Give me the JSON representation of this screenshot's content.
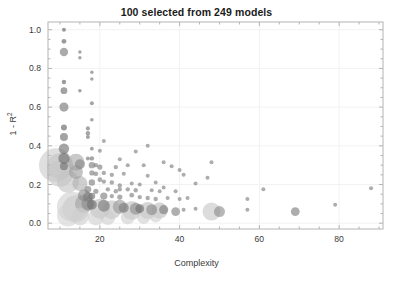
{
  "chart_data": {
    "type": "scatter",
    "title": "100 selected from 249 models",
    "xlabel": "Complexity",
    "ylabel": "1 - R",
    "ylabel_sup": "2",
    "xlim": [
      7,
      91
    ],
    "ylim": [
      -0.03,
      1.04
    ],
    "xticks": [
      20,
      40,
      60,
      80
    ],
    "yticks": [
      "0.0",
      "0.2",
      "0.4",
      "0.6",
      "0.8",
      "1.0"
    ],
    "ytick_values": [
      0.0,
      0.2,
      0.4,
      0.6,
      0.8,
      1.0
    ],
    "grid": true,
    "grid_color": "#f2f2f2",
    "axes_color": "#b4b4b4",
    "marker_dark_color": "#6e6e6e",
    "marker_light_color": "#c8c8c8",
    "marker_opacity": 0.62,
    "background": "#ffffff",
    "legend": "none",
    "points": [
      {
        "x": 11,
        "y": 1.0,
        "s": 2.0,
        "c": "#5e5e5e"
      },
      {
        "x": 11,
        "y": 0.94,
        "s": 2.4,
        "c": "#5e5e5e"
      },
      {
        "x": 11,
        "y": 0.885,
        "s": 4.2,
        "c": "#777777"
      },
      {
        "x": 15,
        "y": 0.885,
        "s": 1.7,
        "c": "#6e6e6e"
      },
      {
        "x": 15,
        "y": 0.855,
        "s": 1.7,
        "c": "#6e6e6e"
      },
      {
        "x": 18,
        "y": 0.78,
        "s": 1.7,
        "c": "#6e6e6e"
      },
      {
        "x": 18,
        "y": 0.745,
        "s": 1.7,
        "c": "#6e6e6e"
      },
      {
        "x": 11,
        "y": 0.73,
        "s": 2.2,
        "c": "#5e5e5e"
      },
      {
        "x": 11,
        "y": 0.685,
        "s": 3.4,
        "c": "#6a6a6a"
      },
      {
        "x": 15,
        "y": 0.685,
        "s": 1.8,
        "c": "#6e6e6e"
      },
      {
        "x": 18,
        "y": 0.62,
        "s": 2.0,
        "c": "#6e6e6e"
      },
      {
        "x": 11,
        "y": 0.6,
        "s": 4.6,
        "c": "#727272"
      },
      {
        "x": 18,
        "y": 0.535,
        "s": 1.8,
        "c": "#6e6e6e"
      },
      {
        "x": 11,
        "y": 0.495,
        "s": 3.0,
        "c": "#5e5e5e"
      },
      {
        "x": 17,
        "y": 0.49,
        "s": 2.1,
        "c": "#6e6e6e"
      },
      {
        "x": 17,
        "y": 0.465,
        "s": 2.2,
        "c": "#6e6e6e"
      },
      {
        "x": 11,
        "y": 0.445,
        "s": 4.0,
        "c": "#6a6a6a"
      },
      {
        "x": 17,
        "y": 0.445,
        "s": 2.0,
        "c": "#6e6e6e"
      },
      {
        "x": 21,
        "y": 0.425,
        "s": 2.0,
        "c": "#7a7a7a"
      },
      {
        "x": 32,
        "y": 0.4,
        "s": 2.0,
        "c": "#7a7a7a"
      },
      {
        "x": 11,
        "y": 0.385,
        "s": 5.2,
        "c": "#6e6e6e"
      },
      {
        "x": 18,
        "y": 0.385,
        "s": 1.9,
        "c": "#6e6e6e"
      },
      {
        "x": 20,
        "y": 0.375,
        "s": 2.0,
        "c": "#7a7a7a"
      },
      {
        "x": 29,
        "y": 0.37,
        "s": 2.0,
        "c": "#7a7a7a"
      },
      {
        "x": 11,
        "y": 0.335,
        "s": 5.6,
        "c": "#6e6e6e"
      },
      {
        "x": 17,
        "y": 0.335,
        "s": 2.0,
        "c": "#6e6e6e"
      },
      {
        "x": 18,
        "y": 0.335,
        "s": 2.2,
        "c": "#6e6e6e"
      },
      {
        "x": 25,
        "y": 0.33,
        "s": 2.0,
        "c": "#7a7a7a"
      },
      {
        "x": 9,
        "y": 0.3,
        "s": 17.0,
        "c": "#cccccc"
      },
      {
        "x": 10,
        "y": 0.295,
        "s": 13.0,
        "c": "#c4c4c4"
      },
      {
        "x": 11,
        "y": 0.295,
        "s": 4.0,
        "c": "#6e6e6e"
      },
      {
        "x": 14,
        "y": 0.315,
        "s": 8.5,
        "c": "#a8a8a8"
      },
      {
        "x": 15,
        "y": 0.305,
        "s": 5.0,
        "c": "#888888"
      },
      {
        "x": 18,
        "y": 0.3,
        "s": 3.2,
        "c": "#7a7a7a"
      },
      {
        "x": 19,
        "y": 0.3,
        "s": 2.2,
        "c": "#7a7a7a"
      },
      {
        "x": 20,
        "y": 0.29,
        "s": 2.6,
        "c": "#7a7a7a"
      },
      {
        "x": 24,
        "y": 0.29,
        "s": 2.2,
        "c": "#7a7a7a"
      },
      {
        "x": 27,
        "y": 0.3,
        "s": 2.0,
        "c": "#7a7a7a"
      },
      {
        "x": 31,
        "y": 0.3,
        "s": 2.0,
        "c": "#7a7a7a"
      },
      {
        "x": 36,
        "y": 0.315,
        "s": 2.0,
        "c": "#7a7a7a"
      },
      {
        "x": 38,
        "y": 0.295,
        "s": 2.0,
        "c": "#7a7a7a"
      },
      {
        "x": 48,
        "y": 0.315,
        "s": 2.0,
        "c": "#7a7a7a"
      },
      {
        "x": 10,
        "y": 0.255,
        "s": 13.0,
        "c": "#c8c8c8"
      },
      {
        "x": 14,
        "y": 0.265,
        "s": 7.0,
        "c": "#9e9e9e"
      },
      {
        "x": 18,
        "y": 0.26,
        "s": 2.6,
        "c": "#7a7a7a"
      },
      {
        "x": 19,
        "y": 0.255,
        "s": 2.4,
        "c": "#7a7a7a"
      },
      {
        "x": 21,
        "y": 0.26,
        "s": 2.2,
        "c": "#7a7a7a"
      },
      {
        "x": 23,
        "y": 0.25,
        "s": 2.2,
        "c": "#7a7a7a"
      },
      {
        "x": 26,
        "y": 0.255,
        "s": 2.0,
        "c": "#7a7a7a"
      },
      {
        "x": 32,
        "y": 0.245,
        "s": 2.0,
        "c": "#7a7a7a"
      },
      {
        "x": 40,
        "y": 0.275,
        "s": 2.0,
        "c": "#7a7a7a"
      },
      {
        "x": 41,
        "y": 0.25,
        "s": 2.0,
        "c": "#7a7a7a"
      },
      {
        "x": 12,
        "y": 0.215,
        "s": 11.0,
        "c": "#c4c4c4"
      },
      {
        "x": 15,
        "y": 0.205,
        "s": 7.5,
        "c": "#b0b0b0"
      },
      {
        "x": 18,
        "y": 0.21,
        "s": 3.2,
        "c": "#7a7a7a"
      },
      {
        "x": 20,
        "y": 0.225,
        "s": 2.4,
        "c": "#7a7a7a"
      },
      {
        "x": 21,
        "y": 0.215,
        "s": 2.2,
        "c": "#7a7a7a"
      },
      {
        "x": 23,
        "y": 0.21,
        "s": 2.2,
        "c": "#7a7a7a"
      },
      {
        "x": 25,
        "y": 0.195,
        "s": 2.2,
        "c": "#7a7a7a"
      },
      {
        "x": 28,
        "y": 0.205,
        "s": 2.0,
        "c": "#7a7a7a"
      },
      {
        "x": 30,
        "y": 0.2,
        "s": 2.0,
        "c": "#7a7a7a"
      },
      {
        "x": 34,
        "y": 0.21,
        "s": 2.0,
        "c": "#7a7a7a"
      },
      {
        "x": 36,
        "y": 0.185,
        "s": 2.0,
        "c": "#7a7a7a"
      },
      {
        "x": 44,
        "y": 0.205,
        "s": 2.0,
        "c": "#7a7a7a"
      },
      {
        "x": 47,
        "y": 0.235,
        "s": 2.0,
        "c": "#7a7a7a"
      },
      {
        "x": 61,
        "y": 0.175,
        "s": 2.0,
        "c": "#7a7a7a"
      },
      {
        "x": 88,
        "y": 0.18,
        "s": 2.0,
        "c": "#7a7a7a"
      },
      {
        "x": 17,
        "y": 0.175,
        "s": 3.4,
        "c": "#7a7a7a"
      },
      {
        "x": 19,
        "y": 0.165,
        "s": 2.6,
        "c": "#7a7a7a"
      },
      {
        "x": 22,
        "y": 0.175,
        "s": 2.2,
        "c": "#7a7a7a"
      },
      {
        "x": 24,
        "y": 0.165,
        "s": 2.2,
        "c": "#7a7a7a"
      },
      {
        "x": 25,
        "y": 0.175,
        "s": 2.2,
        "c": "#7a7a7a"
      },
      {
        "x": 27,
        "y": 0.175,
        "s": 2.2,
        "c": "#7a7a7a"
      },
      {
        "x": 29,
        "y": 0.17,
        "s": 2.2,
        "c": "#7a7a7a"
      },
      {
        "x": 33,
        "y": 0.17,
        "s": 2.0,
        "c": "#7a7a7a"
      },
      {
        "x": 35,
        "y": 0.165,
        "s": 2.0,
        "c": "#7a7a7a"
      },
      {
        "x": 39,
        "y": 0.165,
        "s": 2.0,
        "c": "#7a7a7a"
      },
      {
        "x": 16,
        "y": 0.145,
        "s": 6.0,
        "c": "#8a8a8a"
      },
      {
        "x": 17,
        "y": 0.135,
        "s": 5.0,
        "c": "#7a7a7a"
      },
      {
        "x": 18,
        "y": 0.14,
        "s": 3.4,
        "c": "#6e6e6e"
      },
      {
        "x": 21,
        "y": 0.14,
        "s": 3.6,
        "c": "#7a7a7a"
      },
      {
        "x": 23,
        "y": 0.14,
        "s": 2.2,
        "c": "#7a7a7a"
      },
      {
        "x": 25,
        "y": 0.135,
        "s": 2.6,
        "c": "#7a7a7a"
      },
      {
        "x": 28,
        "y": 0.145,
        "s": 2.4,
        "c": "#7a7a7a"
      },
      {
        "x": 30,
        "y": 0.135,
        "s": 2.2,
        "c": "#7a7a7a"
      },
      {
        "x": 32,
        "y": 0.13,
        "s": 2.2,
        "c": "#7a7a7a"
      },
      {
        "x": 34,
        "y": 0.125,
        "s": 2.2,
        "c": "#7a7a7a"
      },
      {
        "x": 37,
        "y": 0.13,
        "s": 2.0,
        "c": "#7a7a7a"
      },
      {
        "x": 40,
        "y": 0.125,
        "s": 2.0,
        "c": "#7a7a7a"
      },
      {
        "x": 42,
        "y": 0.13,
        "s": 2.0,
        "c": "#7a7a7a"
      },
      {
        "x": 57,
        "y": 0.125,
        "s": 2.0,
        "c": "#7a7a7a"
      },
      {
        "x": 79,
        "y": 0.095,
        "s": 2.0,
        "c": "#7a7a7a"
      },
      {
        "x": 13,
        "y": 0.085,
        "s": 15.0,
        "c": "#d0d0d0"
      },
      {
        "x": 14,
        "y": 0.075,
        "s": 13.5,
        "c": "#cacaca"
      },
      {
        "x": 16,
        "y": 0.1,
        "s": 9.0,
        "c": "#a4a4a4"
      },
      {
        "x": 17,
        "y": 0.1,
        "s": 6.5,
        "c": "#8a8a8a"
      },
      {
        "x": 18,
        "y": 0.095,
        "s": 5.0,
        "c": "#6e6e6e"
      },
      {
        "x": 20,
        "y": 0.075,
        "s": 10.0,
        "c": "#bdbdbd"
      },
      {
        "x": 21,
        "y": 0.09,
        "s": 6.0,
        "c": "#7a7a7a"
      },
      {
        "x": 23,
        "y": 0.07,
        "s": 9.5,
        "c": "#c0c0c0"
      },
      {
        "x": 25,
        "y": 0.085,
        "s": 7.0,
        "c": "#9a9a9a"
      },
      {
        "x": 26,
        "y": 0.08,
        "s": 5.0,
        "c": "#7a7a7a"
      },
      {
        "x": 28,
        "y": 0.065,
        "s": 9.5,
        "c": "#c0c0c0"
      },
      {
        "x": 29,
        "y": 0.075,
        "s": 6.0,
        "c": "#8a8a8a"
      },
      {
        "x": 30,
        "y": 0.075,
        "s": 4.4,
        "c": "#6e6e6e"
      },
      {
        "x": 32,
        "y": 0.065,
        "s": 8.5,
        "c": "#bdbdbd"
      },
      {
        "x": 33,
        "y": 0.07,
        "s": 5.5,
        "c": "#8a8a8a"
      },
      {
        "x": 35,
        "y": 0.065,
        "s": 8.0,
        "c": "#bdbdbd"
      },
      {
        "x": 36,
        "y": 0.07,
        "s": 4.6,
        "c": "#7a7a7a"
      },
      {
        "x": 39,
        "y": 0.06,
        "s": 4.4,
        "c": "#7e7e7e"
      },
      {
        "x": 41,
        "y": 0.07,
        "s": 2.0,
        "c": "#7a7a7a"
      },
      {
        "x": 44,
        "y": 0.075,
        "s": 2.0,
        "c": "#7a7a7a"
      },
      {
        "x": 48,
        "y": 0.06,
        "s": 9.0,
        "c": "#c6c6c6"
      },
      {
        "x": 50,
        "y": 0.06,
        "s": 5.5,
        "c": "#8a8a8a"
      },
      {
        "x": 57,
        "y": 0.07,
        "s": 2.0,
        "c": "#7a7a7a"
      },
      {
        "x": 69,
        "y": 0.06,
        "s": 4.4,
        "c": "#7a7a7a"
      },
      {
        "x": 12,
        "y": 0.04,
        "s": 11.0,
        "c": "#d4d4d4"
      },
      {
        "x": 15,
        "y": 0.035,
        "s": 9.0,
        "c": "#cfcfcf"
      },
      {
        "x": 19,
        "y": 0.03,
        "s": 8.0,
        "c": "#cfcfcf"
      },
      {
        "x": 22,
        "y": 0.03,
        "s": 7.5,
        "c": "#cfcfcf"
      },
      {
        "x": 27,
        "y": 0.03,
        "s": 7.0,
        "c": "#cfcfcf"
      },
      {
        "x": 31,
        "y": 0.03,
        "s": 6.5,
        "c": "#cfcfcf"
      },
      {
        "x": 34,
        "y": 0.035,
        "s": 6.0,
        "c": "#cfcfcf"
      }
    ]
  }
}
